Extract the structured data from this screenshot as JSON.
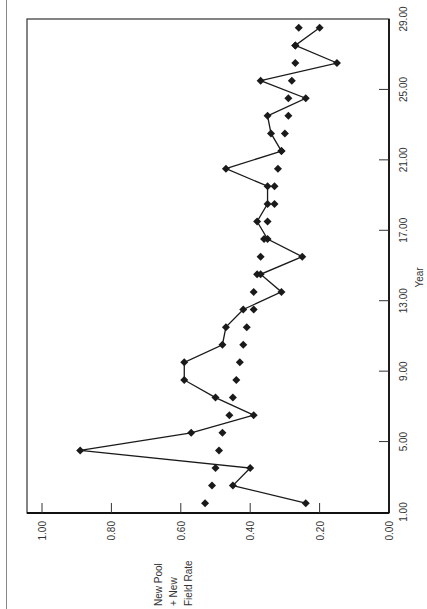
{
  "chart_data": {
    "type": "line",
    "orientation": "rotated-90-clockwise",
    "title": "",
    "xlabel": "Year",
    "ylabel": "New Pool + New Field Rate",
    "ylabel_lines": [
      "New Pool",
      "+ New",
      "Field Rate"
    ],
    "x_ticks": [
      "1.00",
      "5.00",
      "9.00",
      "13.00",
      "17.00",
      "21.00",
      "25.00",
      "29.00"
    ],
    "x_tick_values": [
      1,
      5,
      9,
      13,
      17,
      21,
      25,
      29
    ],
    "y_ticks": [
      "0.00",
      "0.20",
      "0.40",
      "0.60",
      "0.80",
      "1.00"
    ],
    "y_tick_values": [
      0,
      0.2,
      0.4,
      0.6,
      0.8,
      1.0
    ],
    "xlim": [
      1,
      29
    ],
    "ylim": [
      0,
      1.0
    ],
    "grid": false,
    "legend": "none",
    "x": [
      1.5,
      2.5,
      3.5,
      4.5,
      5.5,
      6.5,
      7.5,
      8.5,
      9.5,
      10.5,
      11.5,
      12.5,
      13.5,
      14.5,
      15.5,
      16.5,
      17.5,
      18.5,
      19.5,
      20.5,
      21.5,
      22.5,
      23.5,
      24.5,
      25.5,
      26.5,
      27.5,
      28.5
    ],
    "series": [
      {
        "name": "Observed rate (line with diamond markers)",
        "style": "line-markers",
        "values": [
          0.24,
          0.45,
          0.4,
          0.89,
          0.57,
          0.39,
          0.5,
          0.59,
          0.59,
          0.48,
          0.47,
          0.42,
          0.31,
          0.37,
          0.25,
          0.35,
          0.38,
          0.35,
          0.35,
          0.47,
          0.31,
          0.34,
          0.35,
          0.24,
          0.37,
          0.15,
          0.27,
          0.2
        ]
      },
      {
        "name": "Fitted rate (diamond markers only)",
        "style": "markers",
        "values": [
          0.53,
          0.51,
          0.5,
          0.49,
          0.48,
          0.46,
          0.45,
          0.44,
          0.43,
          0.42,
          0.41,
          0.39,
          0.39,
          0.38,
          0.37,
          0.36,
          0.35,
          0.33,
          0.33,
          0.32,
          0.31,
          0.3,
          0.29,
          0.29,
          0.28,
          0.27,
          0.27,
          0.26
        ]
      }
    ]
  },
  "style": {
    "line_color": "#1a1a1a",
    "marker_color": "#1a1a1a",
    "axis_color": "#333333",
    "background": "#ffffff"
  }
}
